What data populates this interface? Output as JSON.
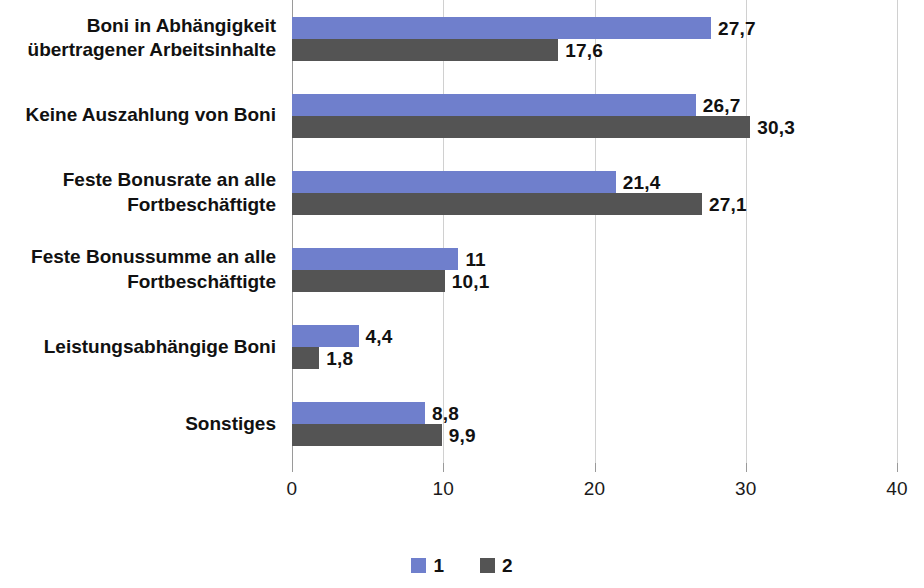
{
  "chart_data": {
    "type": "bar",
    "orientation": "horizontal",
    "title": "",
    "subtitle": "",
    "xlabel": "",
    "ylabel": "",
    "xlim": [
      0,
      40
    ],
    "xticks": [
      "0",
      "10",
      "20",
      "30",
      "40"
    ],
    "xtick_values": [
      0,
      10,
      20,
      30,
      40
    ],
    "grid": true,
    "legend_position": "bottom-center",
    "categories": [
      "Boni in Abhängigkeit\nübertragener Arbeitsinhalte",
      "Keine Auszahlung von Boni",
      "Feste Bonusrate an alle\nFortbeschäftigte",
      "Feste Bonussumme an alle\nFortbeschäftigte",
      "Leistungsabhängige Boni",
      "Sonstiges"
    ],
    "series": [
      {
        "name": "1",
        "color": "#6f7fcc",
        "values": [
          27.7,
          26.7,
          21.4,
          11,
          4.4,
          8.8
        ],
        "labels": [
          "27,7",
          "26,7",
          "21,4",
          "11",
          "4,4",
          "8,8"
        ]
      },
      {
        "name": "2",
        "color": "#545454",
        "values": [
          17.6,
          30.3,
          27.1,
          10.1,
          1.8,
          9.9
        ],
        "labels": [
          "17,6",
          "30,3",
          "27,1",
          "10,1",
          "1,8",
          "9,9"
        ]
      }
    ]
  },
  "legend": {
    "items": [
      {
        "label": "1",
        "color": "#6f7fcc"
      },
      {
        "label": "2",
        "color": "#545454"
      }
    ]
  },
  "colors": {
    "series_1": "#6f7fcc",
    "series_2": "#545454",
    "gridline": "#d0d0d0",
    "axis": "#9a9a9a",
    "text": "#111111",
    "background": "#ffffff"
  }
}
